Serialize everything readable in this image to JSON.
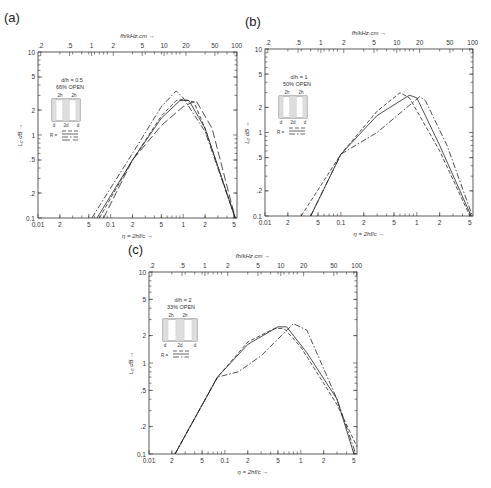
{
  "figure": {
    "top_axis_title": "fh/kHz.cm",
    "bottom_axis_title": "η = 2hf/c",
    "y_axis_title": "L₀ dB",
    "arrow": "→",
    "up_arrow": "↑",
    "y_ticks": [
      "10",
      "5",
      "2",
      "1",
      ".5",
      ".2",
      "0.1"
    ],
    "x_ticks": [
      "0.01",
      "2",
      "5",
      "0.1",
      "2",
      "5",
      "1",
      "2",
      "5"
    ],
    "top_ticks": [
      ".2",
      ".5",
      "1",
      "2",
      "5",
      "10",
      "20",
      "50",
      "100"
    ]
  },
  "panels": [
    {
      "label": "(a)",
      "ratio": "d/h = 0.5",
      "open": "66% OPEN",
      "inset_top": [
        "2h",
        "2h"
      ],
      "inset_bottom": [
        "d",
        "2d",
        "d"
      ],
      "r_label": "R ="
    },
    {
      "label": "(b)",
      "ratio": "d/h = 1",
      "open": "50% OPEN",
      "inset_top": [
        "2h",
        "2h"
      ],
      "inset_bottom": [
        "d",
        "2d",
        "d"
      ],
      "r_label": "R ="
    },
    {
      "label": "(c)",
      "ratio": "d/h = 2",
      "open": "33% OPEN",
      "inset_top": [
        "2h",
        "2h"
      ],
      "inset_bottom": [
        "d",
        "2d",
        "d"
      ],
      "r_label": "R ="
    }
  ],
  "chart_data": [
    {
      "type": "line",
      "title": "(a) d/h = 0.5, 66% OPEN",
      "xlabel": "η = 2hf/c",
      "x2label": "fh/kHz.cm",
      "ylabel": "L₀ dB",
      "xscale": "log",
      "yscale": "log",
      "xlim": [
        0.01,
        5.5
      ],
      "ylim": [
        0.1,
        10
      ],
      "x2lim": [
        0.18,
        100
      ],
      "series": [
        {
          "name": "R = 0 (dashed)",
          "x": [
            0.07,
            0.2,
            0.5,
            0.8,
            1.0,
            1.4,
            2.0,
            5.2
          ],
          "y": [
            0.1,
            0.5,
            1.7,
            2.6,
            2.7,
            2.5,
            1.2,
            0.1
          ]
        },
        {
          "name": "R = 1 (solid)",
          "x": [
            0.065,
            0.2,
            0.5,
            0.9,
            1.2,
            2.0,
            5.2
          ],
          "y": [
            0.1,
            0.5,
            1.6,
            2.6,
            2.6,
            1.2,
            0.1
          ]
        },
        {
          "name": "R = 2 (dash-dot)",
          "x": [
            0.055,
            0.2,
            0.5,
            0.8,
            1.0,
            2.0,
            5.2
          ],
          "y": [
            0.1,
            0.6,
            2.2,
            3.4,
            2.8,
            1.1,
            0.1
          ]
        },
        {
          "name": "R = 5 (long dash)",
          "x": [
            0.08,
            0.2,
            0.5,
            1.0,
            1.5,
            2.5,
            5.2
          ],
          "y": [
            0.1,
            0.5,
            1.3,
            2.2,
            2.6,
            1.2,
            0.1
          ]
        }
      ]
    },
    {
      "type": "line",
      "title": "(b) d/h = 1, 50% OPEN",
      "xlabel": "η = 2hf/c",
      "x2label": "fh/kHz.cm",
      "ylabel": "L₀ dB",
      "xscale": "log",
      "yscale": "log",
      "xlim": [
        0.01,
        5.5
      ],
      "ylim": [
        0.1,
        10
      ],
      "series": [
        {
          "name": "R = 0 (dashed)",
          "x": [
            0.03,
            0.1,
            0.3,
            0.6,
            0.8,
            2.0,
            5.0
          ],
          "y": [
            0.1,
            0.55,
            1.8,
            3.0,
            2.6,
            0.6,
            0.1
          ]
        },
        {
          "name": "R = 1 (solid)",
          "x": [
            0.04,
            0.1,
            0.3,
            0.8,
            1.0,
            2.0,
            5.2
          ],
          "y": [
            0.1,
            0.55,
            1.6,
            2.8,
            2.6,
            0.7,
            0.1
          ]
        },
        {
          "name": "R = ∞ (dash-dot)",
          "x": [
            0.04,
            0.1,
            0.3,
            1.1,
            1.3,
            2.5,
            5.4
          ],
          "y": [
            0.1,
            0.55,
            1.0,
            2.7,
            2.4,
            0.7,
            0.1
          ]
        }
      ]
    },
    {
      "type": "line",
      "title": "(c) d/h = 2, 33% OPEN",
      "xlabel": "η = 2hf/c",
      "x2label": "fh/kHz.cm",
      "ylabel": "L₀ dB",
      "xscale": "log",
      "yscale": "log",
      "xlim": [
        0.01,
        5.5
      ],
      "ylim": [
        0.1,
        10
      ],
      "series": [
        {
          "name": "R = 0 (dashed)",
          "x": [
            0.022,
            0.08,
            0.2,
            0.45,
            0.6,
            1.0,
            3.0,
            5.5
          ],
          "y": [
            0.1,
            0.7,
            1.7,
            2.4,
            2.4,
            1.5,
            0.35,
            0.12
          ]
        },
        {
          "name": "R = 1 (solid)",
          "x": [
            0.022,
            0.08,
            0.2,
            0.5,
            0.65,
            1.2,
            3.0,
            5.0
          ],
          "y": [
            0.1,
            0.7,
            1.6,
            2.5,
            2.5,
            1.3,
            0.4,
            0.1
          ]
        },
        {
          "name": "R = ∞ (dash-dot)",
          "x": [
            0.022,
            0.08,
            0.15,
            0.3,
            0.8,
            1.2,
            3.0,
            5.3
          ],
          "y": [
            0.1,
            0.7,
            0.8,
            1.2,
            2.7,
            2.3,
            0.4,
            0.1
          ]
        }
      ]
    }
  ]
}
